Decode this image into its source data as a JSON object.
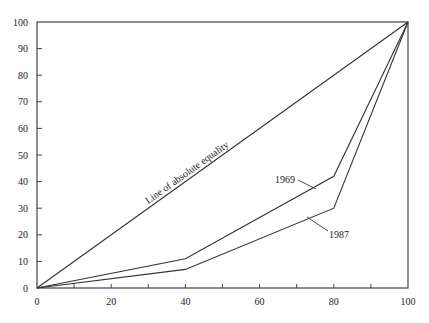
{
  "chart_data": {
    "type": "line",
    "title": "",
    "xlabel": "",
    "ylabel": "",
    "xlim": [
      0,
      100
    ],
    "ylim": [
      0,
      100
    ],
    "grid": false,
    "x_ticks": [
      0,
      20,
      40,
      60,
      80,
      100
    ],
    "x_minor_ticks": [
      10,
      30,
      50,
      70,
      90
    ],
    "y_ticks": [
      0,
      10,
      20,
      30,
      40,
      50,
      60,
      70,
      80,
      90,
      100
    ],
    "series": [
      {
        "name": "Line of absolute equality",
        "x": [
          0,
          100
        ],
        "y": [
          0,
          100
        ]
      },
      {
        "name": "1969",
        "x": [
          0,
          40,
          80,
          100
        ],
        "y": [
          0,
          11,
          42,
          100
        ]
      },
      {
        "name": "1987",
        "x": [
          0,
          40,
          80,
          100
        ],
        "y": [
          0,
          7,
          30,
          100
        ]
      }
    ],
    "annotations": [
      {
        "text": "Line of absolute equality",
        "target_series": "Line of absolute equality",
        "placement": "along-line"
      },
      {
        "text": "1969",
        "target_series": "1969",
        "placement": "left-of-curve"
      },
      {
        "text": "1987",
        "target_series": "1987",
        "placement": "right-of-curve"
      }
    ]
  }
}
